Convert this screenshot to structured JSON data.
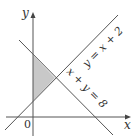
{
  "diagram": {
    "type": "linear-inequality-region",
    "axes": {
      "x_label": "x",
      "y_label": "y",
      "origin_label": "0"
    },
    "lines": [
      {
        "equation": "y = x + 2",
        "label": "y = x + 2"
      },
      {
        "equation": "x + y = 8",
        "label": "x + y = 8"
      }
    ],
    "shaded_region": {
      "description": "triangle bounded by y-axis, y = x + 2 and x + y = 8",
      "vertices": [
        [
          0,
          2
        ],
        [
          3,
          5
        ],
        [
          0,
          8
        ]
      ],
      "fill": "#c8c8c8"
    },
    "colors": {
      "line": "#555555",
      "fill": "#c8c8c8",
      "background": "#ffffff"
    }
  }
}
